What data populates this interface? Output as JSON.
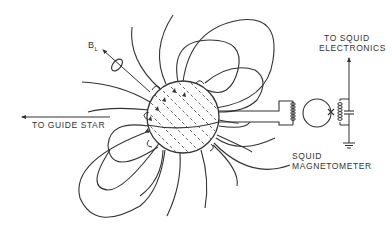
{
  "diagram": {
    "type": "schematic",
    "labels": {
      "london_moment": "B",
      "london_moment_sub": "L",
      "guide_star": "TO GUIDE STAR",
      "squid_electronics_line1": "TO SQUID",
      "squid_electronics_line2": "ELECTRONICS",
      "squid_magnetometer_line1": "SQUID",
      "squid_magnetometer_line2": "MAGNETOMETER"
    },
    "components": [
      "gyroscope-rotor",
      "field-lines",
      "pickup-loop",
      "pickup-coil",
      "squid-ring",
      "josephson-junction",
      "tank-coil",
      "capacitor",
      "ground",
      "readout-arrow"
    ],
    "colors": {
      "line": "#333333",
      "background": "#ffffff"
    }
  }
}
